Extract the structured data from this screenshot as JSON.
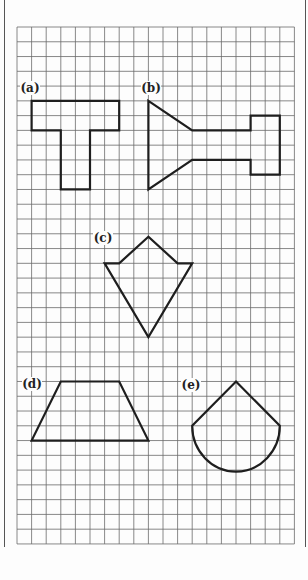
{
  "page": {
    "width": 308,
    "height": 580,
    "background": "#fdfdfd"
  },
  "frame": {
    "left_border_x": 4.5,
    "right_border_x": 305.5,
    "border_top": 0,
    "border_bottom": 547,
    "border_color": "#555555"
  },
  "grid": {
    "origin_x": 17,
    "origin_y": 27,
    "cols": 19,
    "rows": 35,
    "cell_w": 14.6,
    "cell_h": 14.77,
    "line_color": "#6a6a6a",
    "line_width": 0.8
  },
  "shape_style": {
    "stroke": "#1e1e1e",
    "stroke_width": 2.2
  },
  "figures": [
    {
      "id": "a",
      "label": "(a)",
      "label_pos": {
        "x": 30,
        "y": 88
      },
      "type": "polygon",
      "points_grid": [
        [
          1,
          5
        ],
        [
          7,
          5
        ],
        [
          7,
          7
        ],
        [
          5,
          7
        ],
        [
          5,
          11
        ],
        [
          3,
          11
        ],
        [
          3,
          7
        ],
        [
          1,
          7
        ]
      ]
    },
    {
      "id": "b",
      "label": "(b)",
      "label_pos": {
        "x": 151,
        "y": 88
      },
      "type": "polygon",
      "points_grid": [
        [
          9,
          5
        ],
        [
          12,
          7
        ],
        [
          16,
          7
        ],
        [
          16,
          6
        ],
        [
          18,
          6
        ],
        [
          18,
          10
        ],
        [
          16,
          10
        ],
        [
          16,
          9
        ],
        [
          12,
          9
        ],
        [
          9,
          11
        ]
      ]
    },
    {
      "id": "c",
      "label": "(c)",
      "label_pos": {
        "x": 103,
        "y": 238
      },
      "type": "polygon",
      "points_grid": [
        [
          9,
          14.2
        ],
        [
          7,
          16
        ],
        [
          6,
          16
        ],
        [
          9,
          21
        ],
        [
          12,
          16
        ],
        [
          11,
          16
        ]
      ]
    },
    {
      "id": "d",
      "label": "(d)",
      "label_pos": {
        "x": 32,
        "y": 384
      },
      "type": "polygon",
      "points_grid": [
        [
          3,
          24
        ],
        [
          7,
          24
        ],
        [
          9,
          28
        ],
        [
          1,
          28
        ]
      ]
    },
    {
      "id": "e",
      "label": "(e)",
      "label_pos": {
        "x": 191,
        "y": 385
      },
      "type": "cone-semicircle",
      "apex_grid": [
        15,
        24
      ],
      "left_grid": [
        12,
        27
      ],
      "right_grid": [
        18,
        27
      ]
    }
  ]
}
